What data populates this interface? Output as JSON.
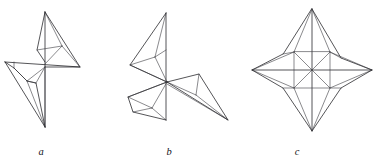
{
  "plate": {
    "name": "star-polyhedra-line-drawings",
    "background_color": "#ffffff",
    "line_color": "#1c1c20",
    "panel_count": 3
  },
  "captions": {
    "a": "a",
    "b": "b",
    "c": "c"
  },
  "figures": [
    {
      "id": "a",
      "label": "a",
      "caption_x": 41,
      "caption_y": 155,
      "description": "four-pointed pinwheel star, oblique view, unequal arms",
      "center": [
        45,
        67
      ],
      "tips": [
        {
          "name": "top",
          "x": 45,
          "y": 12
        },
        {
          "name": "right",
          "x": 80,
          "y": 67
        },
        {
          "name": "left",
          "x": 5,
          "y": 62
        },
        {
          "name": "bottom",
          "x": 45,
          "y": 127
        }
      ],
      "ridge_points": [
        {
          "name": "upper-right-ridge",
          "x": 62,
          "y": 46
        },
        {
          "name": "lower-left-ridge",
          "x": 27,
          "y": 81
        }
      ],
      "arm_corners": [
        {
          "name": "upper-left-corner",
          "x": 37,
          "y": 50
        },
        {
          "name": "lower-left-corner",
          "x": 14,
          "y": 68
        },
        {
          "name": "lower-right-corner",
          "x": 36,
          "y": 83
        }
      ]
    },
    {
      "id": "b",
      "label": "b",
      "caption_x": 169,
      "caption_y": 155,
      "description": "three-pointed star, oblique view, long lower-right arm",
      "center": [
        167,
        82
      ],
      "tips": [
        {
          "name": "top",
          "x": 166,
          "y": 13
        },
        {
          "name": "lower-right",
          "x": 228,
          "y": 120
        },
        {
          "name": "left",
          "x": 130,
          "y": 65
        },
        {
          "name": "lower",
          "x": 166,
          "y": 120
        }
      ],
      "ridge_points": [
        {
          "name": "upper-ridge",
          "x": 155,
          "y": 57
        },
        {
          "name": "right-ridge",
          "x": 199,
          "y": 74
        },
        {
          "name": "lower-ridge",
          "x": 152,
          "y": 108
        }
      ]
    },
    {
      "id": "c",
      "label": "c",
      "caption_x": 297,
      "caption_y": 155,
      "description": "symmetric four-pointed star with inner pinwheel facets",
      "center": [
        312,
        70
      ],
      "tips": [
        {
          "name": "top",
          "x": 312,
          "y": 9
        },
        {
          "name": "right",
          "x": 372,
          "y": 70
        },
        {
          "name": "bottom",
          "x": 312,
          "y": 131
        },
        {
          "name": "left",
          "x": 252,
          "y": 70
        }
      ],
      "ridge_points": [
        {
          "name": "ne-ridge",
          "x": 330,
          "y": 52
        },
        {
          "name": "se-ridge",
          "x": 330,
          "y": 88
        },
        {
          "name": "sw-ridge",
          "x": 294,
          "y": 88
        },
        {
          "name": "nw-ridge",
          "x": 294,
          "y": 52
        }
      ]
    }
  ]
}
